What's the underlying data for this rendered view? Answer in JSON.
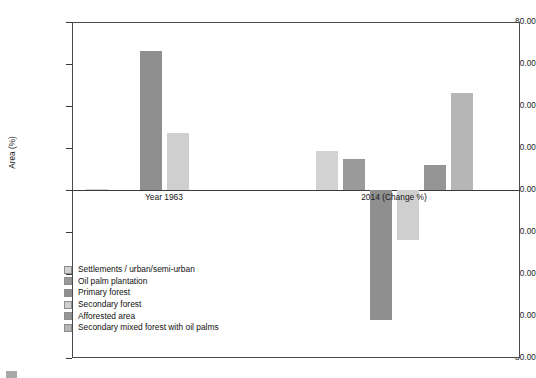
{
  "chart_data": {
    "type": "bar",
    "title": "",
    "xlabel": "",
    "ylabel": "Area (%)",
    "ylim": [
      -80,
      80
    ],
    "ytick_step": 20,
    "ytick_labels": [
      "80.00",
      "60.00",
      "40.00",
      "20.00",
      "0.00",
      "-20.00",
      "-40.00",
      "-60.00",
      "-80.00"
    ],
    "ytick_values": [
      80,
      60,
      40,
      20,
      0,
      -20,
      -40,
      -60,
      -80
    ],
    "grid": false,
    "legend_position": "lower-left-inside",
    "categories": [
      "Year 1963",
      "2014 (Change %)"
    ],
    "series": [
      {
        "name": "Settlements / urban/semi-urban",
        "color": "#d2d2d2",
        "values": [
          0.4,
          18.5
        ]
      },
      {
        "name": "Oil palm plantation",
        "color": "#9a9a9a",
        "values": [
          0.0,
          15.0
        ]
      },
      {
        "name": "Primary forest",
        "color": "#8f8f8f",
        "values": [
          66.0,
          -62.0
        ]
      },
      {
        "name": "Secondary forest",
        "color": "#cfcfcf",
        "values": [
          27.0,
          -24.0
        ]
      },
      {
        "name": "Afforested area",
        "color": "#959595",
        "values": [
          0.0,
          12.0
        ]
      },
      {
        "name": "Secondary mixed forest with oil palms",
        "color": "#b6b6b6",
        "values": [
          0.0,
          46.0
        ]
      }
    ]
  },
  "legend": {
    "items": [
      {
        "label": "Settlements / urban/semi-urban",
        "color": "#d2d2d2"
      },
      {
        "label": "Oil palm plantation",
        "color": "#9a9a9a"
      },
      {
        "label": "Primary forest",
        "color": "#8f8f8f"
      },
      {
        "label": "Secondary forest",
        "color": "#cfcfcf"
      },
      {
        "label": "Afforested area",
        "color": "#959595"
      },
      {
        "label": "Secondary mixed forest with oil palms",
        "color": "#b6b6b6"
      }
    ]
  },
  "caption": {
    "text": ""
  },
  "colors": {
    "axis": "#3b3b3b",
    "frame": "#4a4a4a",
    "text": "#111111",
    "background": "#ffffff"
  }
}
